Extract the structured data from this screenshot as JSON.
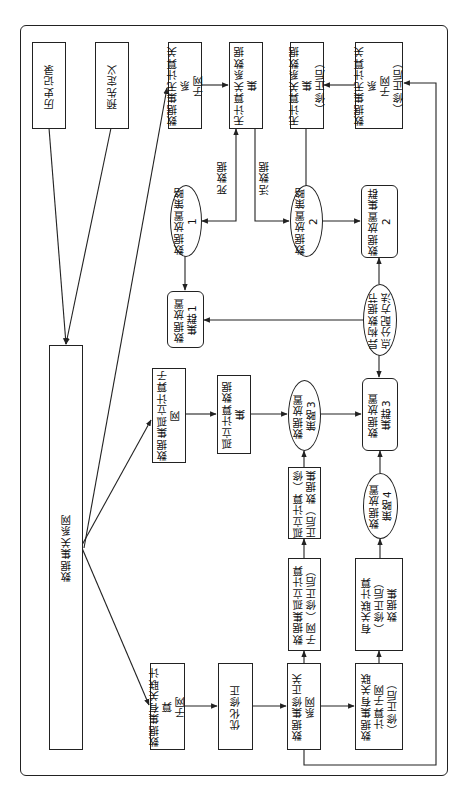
{
  "diagram": {
    "orientation": "rotated-90-ccw",
    "nodes": {
      "history": {
        "label": "历史记录",
        "shape": "rect"
      },
      "predefined": {
        "label": "预先定义",
        "shape": "rect"
      },
      "dataset_relation_net": {
        "label": "数据集关系网",
        "shape": "rect"
      },
      "noncompute_subnet": {
        "label": "数据集无计算关系\n子网",
        "shape": "rect"
      },
      "noncompute_dataset": {
        "label": "无计算关系数据集",
        "shape": "rect"
      },
      "noncompute_dataset_fixed": {
        "label": "无计算关系数据集\n（修正后）",
        "shape": "rect"
      },
      "noncompute_subnet_fixed": {
        "label": "数据集无计算关系\n子网\n（修正后）",
        "shape": "rect"
      },
      "strategy1": {
        "label": "数据放置策略1",
        "shape": "ellipse"
      },
      "strategy2": {
        "label": "数据放置策略2",
        "shape": "ellipse"
      },
      "cluster2": {
        "label": "数据放置集群2",
        "shape": "rounded"
      },
      "cluster1": {
        "label": "数据放置\n集群1",
        "shape": "rounded"
      },
      "hetero_alloc": {
        "label": "异构数据节\n点分配方法",
        "shape": "ellipse"
      },
      "isolated_subnet": {
        "label": "数据集孤立计算子网",
        "shape": "rect"
      },
      "isolated_dataset": {
        "label": "孤立计算数据集",
        "shape": "rect"
      },
      "strategy3": {
        "label": "数据放置\n策略3",
        "shape": "ellipse"
      },
      "cluster3": {
        "label": "数据放置\n集群3",
        "shape": "rounded"
      },
      "isolated_dataset_fixed": {
        "label": "孤立计算（修\n正后）数据集",
        "shape": "rect"
      },
      "strategy4": {
        "label": "数据放置\n策略4",
        "shape": "ellipse"
      },
      "isolated_subnet_fixed": {
        "label": "数据集孤立计算\n子网（修正后）",
        "shape": "rect"
      },
      "related_dataset_fixed": {
        "label": "有关联计算\n（修正后）\n数据集",
        "shape": "rect"
      },
      "related_subnet": {
        "label": "数据集有关联计算\n子网",
        "shape": "rect"
      },
      "optimize_fix": {
        "label": "优化修正",
        "shape": "rect"
      },
      "fixed_relation_net": {
        "label": "数据集修正关\n系网",
        "shape": "rect"
      },
      "related_subnet_fixed": {
        "label": "数据集有关联\n计算子网\n（修正后）",
        "shape": "rect"
      }
    },
    "edge_labels": {
      "dead_data": "死数据",
      "live_data": "活数据"
    },
    "edges": [
      {
        "from": "history",
        "to": "dataset_relation_net"
      },
      {
        "from": "predefined",
        "to": "dataset_relation_net"
      },
      {
        "from": "dataset_relation_net",
        "to": "noncompute_subnet"
      },
      {
        "from": "dataset_relation_net",
        "to": "isolated_subnet"
      },
      {
        "from": "dataset_relation_net",
        "to": "related_subnet"
      },
      {
        "from": "noncompute_subnet",
        "to": "noncompute_dataset"
      },
      {
        "from": "noncompute_dataset",
        "to": "strategy1",
        "label": "死数据"
      },
      {
        "from": "noncompute_dataset",
        "to": "strategy2",
        "label": "活数据"
      },
      {
        "from": "strategy1",
        "to": "cluster1"
      },
      {
        "from": "strategy2",
        "to": "cluster2"
      },
      {
        "from": "noncompute_subnet_fixed",
        "to": "noncompute_dataset_fixed"
      },
      {
        "from": "noncompute_dataset_fixed",
        "to": "strategy2"
      },
      {
        "from": "hetero_alloc",
        "to": "cluster1"
      },
      {
        "from": "hetero_alloc",
        "to": "cluster2"
      },
      {
        "from": "hetero_alloc",
        "to": "cluster3"
      },
      {
        "from": "isolated_subnet",
        "to": "isolated_dataset"
      },
      {
        "from": "isolated_dataset",
        "to": "strategy3"
      },
      {
        "from": "strategy3",
        "to": "cluster3"
      },
      {
        "from": "isolated_dataset_fixed",
        "to": "strategy3"
      },
      {
        "from": "isolated_subnet_fixed",
        "to": "isolated_dataset_fixed"
      },
      {
        "from": "related_dataset_fixed",
        "to": "strategy4"
      },
      {
        "from": "strategy4",
        "to": "cluster3"
      },
      {
        "from": "related_subnet",
        "to": "optimize_fix"
      },
      {
        "from": "optimize_fix",
        "to": "fixed_relation_net"
      },
      {
        "from": "fixed_relation_net",
        "to": "related_subnet_fixed"
      },
      {
        "from": "fixed_relation_net",
        "to": "isolated_subnet_fixed"
      },
      {
        "from": "related_subnet_fixed",
        "to": "related_dataset_fixed"
      },
      {
        "from": "fixed_relation_net",
        "to": "noncompute_subnet_fixed"
      }
    ]
  }
}
